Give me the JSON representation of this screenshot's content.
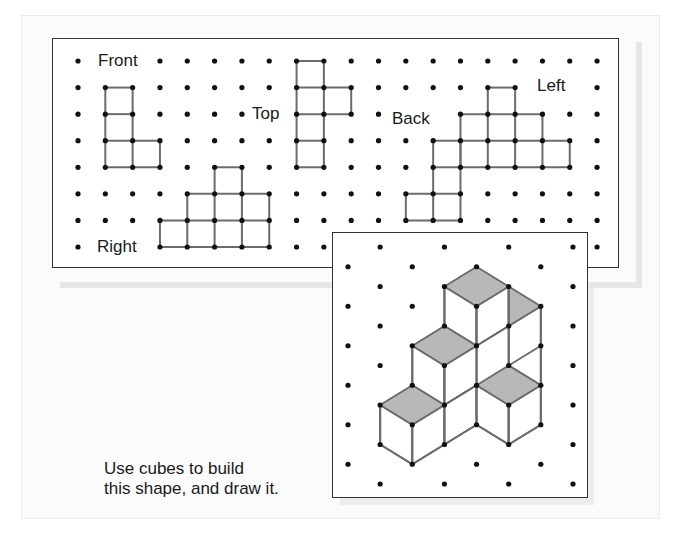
{
  "labels": {
    "front": "Front",
    "top": "Top",
    "back": "Back",
    "left": "Left",
    "right": "Right"
  },
  "instruction": {
    "line1": "Use cubes to build",
    "line2": "this shape, and draw it."
  },
  "colors": {
    "line": "#6b6b6b",
    "dot": "#111111",
    "shade": "#b8b8b8",
    "panel_border": "#333333"
  },
  "square_grid": {
    "origin": [
      78,
      61
    ],
    "step": [
      27.32,
      26.57
    ],
    "cols": 20,
    "rows": 8
  },
  "views": [
    {
      "name": "front",
      "h": [
        [
          1,
          2,
          1
        ],
        [
          1,
          2,
          2
        ],
        [
          1,
          3,
          3
        ],
        [
          1,
          3,
          4
        ]
      ],
      "v": [
        [
          1,
          1,
          4
        ],
        [
          2,
          1,
          4
        ],
        [
          3,
          3,
          4
        ]
      ]
    },
    {
      "name": "top",
      "h": [
        [
          8,
          9,
          0
        ],
        [
          8,
          10,
          1
        ],
        [
          8,
          10,
          2
        ],
        [
          8,
          9,
          3
        ],
        [
          8,
          9,
          4
        ]
      ],
      "v": [
        [
          8,
          0,
          4
        ],
        [
          9,
          0,
          4
        ],
        [
          10,
          1,
          2
        ]
      ]
    },
    {
      "name": "back",
      "h": [
        [
          13,
          14,
          3
        ],
        [
          13,
          14,
          4
        ],
        [
          12,
          14,
          5
        ],
        [
          12,
          14,
          6
        ]
      ],
      "v": [
        [
          12,
          5,
          6
        ],
        [
          13,
          3,
          6
        ],
        [
          14,
          3,
          6
        ]
      ]
    },
    {
      "name": "left",
      "h": [
        [
          15,
          16,
          1
        ],
        [
          14,
          17,
          2
        ],
        [
          14,
          18,
          3
        ],
        [
          14,
          18,
          4
        ]
      ],
      "v": [
        [
          14,
          2,
          4
        ],
        [
          15,
          1,
          4
        ],
        [
          16,
          1,
          4
        ],
        [
          17,
          2,
          4
        ],
        [
          18,
          3,
          4
        ]
      ]
    },
    {
      "name": "right",
      "h": [
        [
          5,
          6,
          4
        ],
        [
          4,
          7,
          5
        ],
        [
          3,
          7,
          6
        ],
        [
          3,
          7,
          7
        ]
      ],
      "v": [
        [
          3,
          6,
          7
        ],
        [
          4,
          5,
          7
        ],
        [
          5,
          4,
          7
        ],
        [
          6,
          4,
          7
        ],
        [
          7,
          5,
          7
        ]
      ]
    }
  ],
  "hidden_dots": [
    [
      1,
      0
    ],
    [
      2,
      0
    ],
    [
      7,
      2
    ],
    [
      13,
      2
    ],
    [
      17,
      1
    ],
    [
      18,
      1
    ],
    [
      1,
      7
    ],
    [
      2,
      7
    ],
    [
      10,
      7
    ],
    [
      11,
      7
    ],
    [
      12,
      7
    ],
    [
      13,
      7
    ],
    [
      14,
      7
    ],
    [
      15,
      7
    ],
    [
      16,
      7
    ],
    [
      17,
      7
    ],
    [
      18,
      7
    ]
  ],
  "iso_grid": {
    "origin": [
      348,
      247
    ],
    "step": [
      32.14,
      19.75
    ],
    "cols": 8,
    "rows": 13
  },
  "iso_shape": {
    "shaded_faces": [
      [
        [
          4,
          1
        ],
        [
          3,
          2
        ],
        [
          4,
          3
        ],
        [
          5,
          2
        ]
      ],
      [
        [
          5,
          2
        ],
        [
          6,
          3
        ],
        [
          5,
          4
        ]
      ],
      [
        [
          3,
          4
        ],
        [
          2,
          5
        ],
        [
          3,
          6
        ],
        [
          4,
          5
        ]
      ],
      [
        [
          2,
          7
        ],
        [
          1,
          8
        ],
        [
          2,
          9
        ],
        [
          3,
          8
        ]
      ],
      [
        [
          5,
          6
        ],
        [
          4,
          7
        ],
        [
          5,
          8
        ],
        [
          6,
          7
        ]
      ]
    ],
    "white_faces": [
      [
        [
          3,
          2
        ],
        [
          4,
          3
        ],
        [
          4,
          5
        ],
        [
          3,
          4
        ]
      ],
      [
        [
          4,
          3
        ],
        [
          5,
          2
        ],
        [
          5,
          4
        ],
        [
          4,
          5
        ]
      ],
      [
        [
          2,
          5
        ],
        [
          3,
          6
        ],
        [
          3,
          8
        ],
        [
          2,
          7
        ]
      ],
      [
        [
          3,
          6
        ],
        [
          4,
          5
        ],
        [
          4,
          7
        ],
        [
          3,
          8
        ]
      ],
      [
        [
          1,
          8
        ],
        [
          2,
          9
        ],
        [
          2,
          11
        ],
        [
          1,
          10
        ]
      ],
      [
        [
          2,
          9
        ],
        [
          3,
          8
        ],
        [
          3,
          10
        ],
        [
          2,
          11
        ]
      ],
      [
        [
          3,
          8
        ],
        [
          4,
          7
        ],
        [
          4,
          9
        ],
        [
          3,
          10
        ]
      ],
      [
        [
          4,
          7
        ],
        [
          5,
          8
        ],
        [
          5,
          10
        ],
        [
          4,
          9
        ]
      ],
      [
        [
          5,
          8
        ],
        [
          6,
          7
        ],
        [
          6,
          9
        ],
        [
          5,
          10
        ]
      ],
      [
        [
          5,
          4
        ],
        [
          6,
          3
        ],
        [
          6,
          7
        ],
        [
          5,
          6
        ]
      ]
    ],
    "segments": [
      [
        [
          1,
          8
        ],
        [
          1,
          10
        ]
      ],
      [
        [
          2,
          9
        ],
        [
          2,
          11
        ]
      ],
      [
        [
          2,
          5
        ],
        [
          2,
          7
        ]
      ],
      [
        [
          3,
          2
        ],
        [
          3,
          4
        ]
      ],
      [
        [
          3,
          6
        ],
        [
          3,
          10
        ]
      ],
      [
        [
          4,
          3
        ],
        [
          4,
          5
        ]
      ],
      [
        [
          4,
          5
        ],
        [
          4,
          9
        ]
      ],
      [
        [
          5,
          2
        ],
        [
          5,
          6
        ]
      ],
      [
        [
          5,
          8
        ],
        [
          5,
          10
        ]
      ],
      [
        [
          6,
          3
        ],
        [
          6,
          9
        ]
      ],
      [
        [
          1,
          10
        ],
        [
          2,
          11
        ]
      ],
      [
        [
          2,
          11
        ],
        [
          3,
          10
        ]
      ],
      [
        [
          3,
          10
        ],
        [
          4,
          9
        ]
      ],
      [
        [
          4,
          9
        ],
        [
          5,
          10
        ]
      ],
      [
        [
          5,
          10
        ],
        [
          6,
          9
        ]
      ],
      [
        [
          3,
          8
        ],
        [
          4,
          7
        ]
      ],
      [
        [
          4,
          5
        ],
        [
          5,
          4
        ]
      ],
      [
        [
          5,
          6
        ],
        [
          6,
          5
        ]
      ]
    ]
  }
}
